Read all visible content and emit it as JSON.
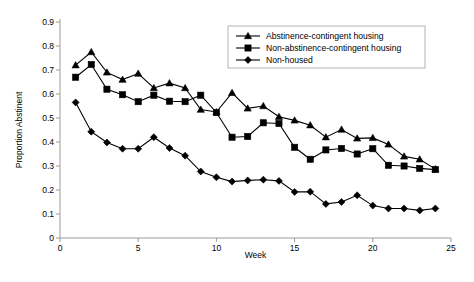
{
  "chart_data": {
    "type": "line",
    "title": "",
    "xlabel": "Week",
    "ylabel": "Proportion Abstinent",
    "xlim": [
      0,
      25
    ],
    "ylim": [
      0,
      0.9
    ],
    "xticks": [
      0,
      5,
      10,
      15,
      20,
      25
    ],
    "xtick_labels": [
      "0",
      "5",
      "10",
      "15",
      "20",
      "25"
    ],
    "yticks": [
      0,
      0.1,
      0.2,
      0.3,
      0.4,
      0.5,
      0.6,
      0.7,
      0.8,
      0.9
    ],
    "ytick_labels": [
      "0",
      "0.1",
      "0.2",
      "0.3",
      "0.4",
      "0.5",
      "0.6",
      "0.7",
      "0.8",
      "0.9"
    ],
    "grid": false,
    "legend_position": "top-right",
    "x": [
      1,
      2,
      3,
      4,
      5,
      6,
      7,
      8,
      9,
      10,
      11,
      12,
      13,
      14,
      15,
      16,
      17,
      18,
      19,
      20,
      21,
      22,
      23,
      24
    ],
    "series": [
      {
        "name": "Abstinence-contingent housing",
        "marker": "triangle",
        "color": "#000000",
        "values": [
          0.72,
          0.775,
          0.69,
          0.66,
          0.685,
          0.625,
          0.645,
          0.625,
          0.535,
          0.525,
          0.605,
          0.54,
          0.55,
          0.505,
          0.49,
          0.47,
          0.42,
          0.452,
          0.415,
          0.417,
          0.39,
          0.34,
          0.328,
          0.287
        ]
      },
      {
        "name": "Non-abstinence-contingent housing",
        "marker": "square",
        "color": "#000000",
        "values": [
          0.67,
          0.723,
          0.62,
          0.597,
          0.568,
          0.595,
          0.57,
          0.568,
          0.595,
          0.523,
          0.42,
          0.423,
          0.48,
          0.477,
          0.378,
          0.328,
          0.367,
          0.373,
          0.35,
          0.372,
          0.303,
          0.3,
          0.29,
          0.285
        ]
      },
      {
        "name": "Non-housed",
        "marker": "diamond",
        "color": "#000000",
        "values": [
          0.565,
          0.443,
          0.398,
          0.372,
          0.372,
          0.42,
          0.375,
          0.343,
          0.277,
          0.253,
          0.235,
          0.24,
          0.243,
          0.238,
          0.192,
          0.193,
          0.142,
          0.15,
          0.178,
          0.135,
          0.123,
          0.123,
          0.115,
          0.123
        ]
      }
    ]
  }
}
